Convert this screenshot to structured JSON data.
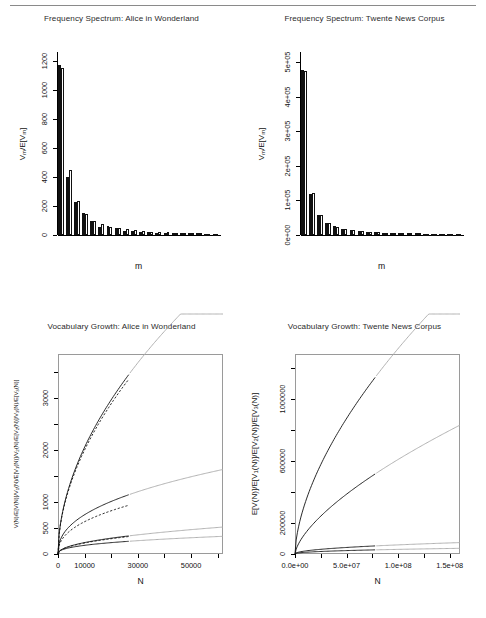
{
  "figure": {
    "panels": [
      {
        "id": "freq-alice",
        "title": "Frequency Spectrum: Alice in Wonderland",
        "xlabel": "m",
        "ylabel": "V_m/E[V_m]"
      },
      {
        "id": "freq-twente",
        "title": "Frequency Spectrum: Twente News Corpus",
        "xlabel": "m",
        "ylabel": "V_m/E[V_m]"
      },
      {
        "id": "vocab-alice",
        "title": "Vocabulary Growth: Alice in Wonderland",
        "xlabel": "N",
        "ylabel": "V(N)/E[V(N)]/V1(N)/E[V1(N)]/V2(N)/E[V2(N)]/V3(N)/E[V3(N)]"
      },
      {
        "id": "vocab-twente",
        "title": "Vocabulary Growth: Twente News Corpus",
        "xlabel": "N",
        "ylabel": "E[V(N)]/E[V1(N)]/E[V2(N)]/E[V3(N)]"
      }
    ]
  },
  "chart_data": [
    {
      "type": "bar",
      "id": "freq-alice",
      "title": "Frequency Spectrum: Alice in Wonderland",
      "xlabel": "m",
      "ylabel": "V_m/E[V_m]",
      "categories": [
        1,
        2,
        3,
        4,
        5,
        6,
        7,
        8,
        9,
        10,
        11,
        12,
        13,
        14,
        15,
        16,
        17,
        18,
        19,
        20
      ],
      "yticks": [
        0,
        200,
        400,
        600,
        800,
        1000,
        1200
      ],
      "ylim": [
        0,
        1260
      ],
      "grid": false,
      "legend": "none",
      "series": [
        {
          "name": "observed Vm",
          "color": "#111111",
          "values": [
            1170,
            398,
            228,
            149,
            96,
            58,
            63,
            48,
            28,
            28,
            22,
            21,
            16,
            17,
            12,
            14,
            11,
            12,
            9,
            8
          ]
        },
        {
          "name": "expected E[Vm]",
          "color": "#ffffff",
          "values": [
            1152,
            447,
            231,
            144,
            99,
            74,
            58,
            46,
            38,
            32,
            27,
            23,
            20,
            18,
            16,
            14,
            13,
            11,
            10,
            9
          ]
        }
      ]
    },
    {
      "type": "bar",
      "id": "freq-twente",
      "title": "Frequency Spectrum: Twente News Corpus",
      "xlabel": "m",
      "ylabel": "V_m/E[V_m]",
      "categories": [
        1,
        2,
        3,
        4,
        5,
        6,
        7,
        8,
        9,
        10,
        11,
        12,
        13,
        14,
        15,
        16,
        17,
        18,
        19,
        20
      ],
      "yticks": [
        0,
        100000,
        200000,
        300000,
        400000,
        500000
      ],
      "yticklabels": [
        "0e+00",
        "1e+05",
        "2e+05",
        "3e+05",
        "4e+05",
        "5e+05"
      ],
      "ylim": [
        0,
        530000
      ],
      "grid": false,
      "legend": "none",
      "series": [
        {
          "name": "observed Vm",
          "color": "#111111",
          "values": [
            478000,
            120000,
            59000,
            36000,
            25000,
            18500,
            14500,
            11800,
            9800,
            8300,
            7200,
            6300,
            5600,
            5000,
            4500,
            4100,
            3700,
            3400,
            3100,
            2900
          ]
        },
        {
          "name": "expected E[Vm]",
          "color": "#ffffff",
          "values": [
            476000,
            122000,
            58000,
            35000,
            24000,
            18000,
            14000,
            11500,
            9600,
            8200,
            7100,
            6200,
            5500,
            4900,
            4400,
            4000,
            3650,
            3350,
            3080,
            2850
          ]
        }
      ]
    },
    {
      "type": "line",
      "id": "vocab-alice",
      "title": "Vocabulary Growth: Alice in Wonderland",
      "xlabel": "N",
      "ylabel": "V(N)/E[V(N)]/V1(N)/E[V1(N)]/V2(N)/E[V2(N)]/V3(N)/E[V3(N)]",
      "xticks": [
        0,
        10000,
        30000,
        50000
      ],
      "yticks": [
        0,
        500,
        1000,
        2000,
        3000
      ],
      "xlim": [
        0,
        62000
      ],
      "ylim": [
        0,
        3850
      ],
      "observed_limit_N": 27000,
      "grid": false,
      "legend": "none",
      "series": [
        {
          "name": "E[V(N)] expected vocabulary",
          "style": "solid",
          "color": "#111111",
          "k": 15.6,
          "alpha": 0.53
        },
        {
          "name": "V(N) observed vocabulary",
          "style": "dashed",
          "color": "#111111",
          "k": 15.2,
          "alpha": 0.53
        },
        {
          "name": "E[V1(N)] expected hapax",
          "style": "solid",
          "color": "#111111",
          "k": 15.8,
          "alpha": 0.42
        },
        {
          "name": "V1(N) observed hapax",
          "style": "dashed",
          "color": "#111111",
          "k": 13.0,
          "alpha": 0.42
        },
        {
          "name": "E[V2(N)] expected dis legomena",
          "style": "solid",
          "color": "#111111",
          "k": 2.9,
          "alpha": 0.47
        },
        {
          "name": "V2(N) observed dis legomena",
          "style": "dashed",
          "color": "#111111",
          "k": 2.8,
          "alpha": 0.47
        },
        {
          "name": "E[V3(N)] expected tris legomena",
          "style": "solid",
          "color": "#111111",
          "k": 4.6,
          "alpha": 0.39
        }
      ]
    },
    {
      "type": "line",
      "id": "vocab-twente",
      "title": "Vocabulary Growth: Twente News Corpus",
      "xlabel": "N",
      "ylabel": "E[V(N)]/E[V1(N)]/E[V2(N)]/E[V3(N)]",
      "xticks": [
        0,
        50000000,
        100000000,
        150000000
      ],
      "xticklabels": [
        "0.0e+00",
        "5.0e+07",
        "1.0e+08",
        "1.5e+08"
      ],
      "yticks": [
        0,
        200000,
        600000,
        1000000
      ],
      "xlim": [
        0,
        160000000
      ],
      "ylim": [
        0,
        1290000
      ],
      "observed_limit_N": 78000000,
      "grid": false,
      "legend": "none",
      "series": [
        {
          "name": "E[V(N)] expected vocabulary",
          "style": "solid",
          "color": "#111111",
          "k": 21.0,
          "alpha": 0.6
        },
        {
          "name": "E[V1(N)] expected hapax",
          "style": "solid",
          "color": "#111111",
          "k": 3.2,
          "alpha": 0.66
        },
        {
          "name": "E[V2(N)] expected dis legomena",
          "style": "solid",
          "color": "#111111",
          "k": 8.5,
          "alpha": 0.48
        },
        {
          "name": "E[V3(N)] expected tris legomena",
          "style": "solid",
          "color": "#111111",
          "k": 9.0,
          "alpha": 0.44
        }
      ]
    }
  ]
}
